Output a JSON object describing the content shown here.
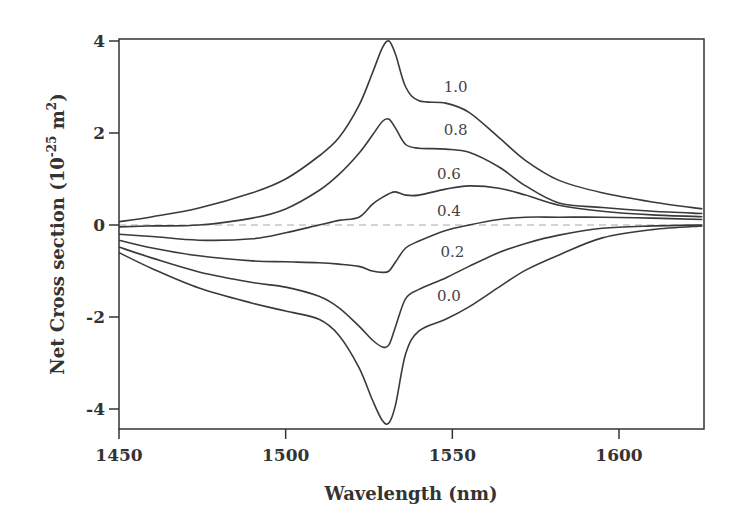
{
  "chart_data": {
    "type": "line",
    "title": "",
    "xlabel": "Wavelength (nm)",
    "ylabel": "Net Cross section (10^-25 m^2)",
    "ylabel_parts": {
      "main": "Net Cross section (10",
      "exp1": "-25",
      "mid": " m",
      "exp2": "2",
      "end": ")"
    },
    "xlim": [
      1450,
      1625
    ],
    "ylim": [
      -4.4,
      4.1
    ],
    "xticks": [
      1450,
      1500,
      1550,
      1600
    ],
    "xtick_labels": [
      "1450",
      "1500",
      "1550",
      "1600"
    ],
    "yticks": [
      4,
      2,
      0,
      -2,
      -4
    ],
    "ytick_labels": [
      "4",
      "2",
      "0",
      "-2",
      "-4"
    ],
    "grid": false,
    "legend": "inline labels",
    "reference_line": {
      "y": 0,
      "style": "dashed"
    },
    "x": [
      1450,
      1460,
      1474,
      1490,
      1500,
      1510,
      1516,
      1522,
      1526,
      1529,
      1531,
      1533,
      1536,
      1540,
      1548,
      1555,
      1564,
      1572,
      1582,
      1595,
      1610,
      1625
    ],
    "series": [
      {
        "name": "1.0",
        "label": "1.0",
        "label_pos": [
          1551,
          2.9
        ],
        "values": [
          0.07,
          0.18,
          0.37,
          0.7,
          1.0,
          1.5,
          1.9,
          2.6,
          3.3,
          3.85,
          4.0,
          3.7,
          3.0,
          2.7,
          2.65,
          2.45,
          1.9,
          1.4,
          0.97,
          0.7,
          0.5,
          0.35
        ]
      },
      {
        "name": "0.8",
        "label": "0.8",
        "label_pos": [
          1551,
          1.95
        ],
        "values": [
          -0.04,
          -0.02,
          0.0,
          0.15,
          0.35,
          0.75,
          1.1,
          1.56,
          1.95,
          2.25,
          2.3,
          2.1,
          1.75,
          1.67,
          1.65,
          1.58,
          1.26,
          0.85,
          0.48,
          0.38,
          0.3,
          0.25
        ]
      },
      {
        "name": "0.6",
        "label": "0.6",
        "label_pos": [
          1549,
          1.0
        ],
        "values": [
          -0.2,
          -0.25,
          -0.33,
          -0.3,
          -0.17,
          0.0,
          0.1,
          0.17,
          0.45,
          0.6,
          0.68,
          0.72,
          0.65,
          0.65,
          0.78,
          0.85,
          0.8,
          0.65,
          0.43,
          0.3,
          0.22,
          0.18
        ]
      },
      {
        "name": "0.4",
        "label": "0.4",
        "label_pos": [
          1549,
          0.2
        ],
        "values": [
          -0.33,
          -0.5,
          -0.67,
          -0.78,
          -0.8,
          -0.82,
          -0.85,
          -0.9,
          -1.0,
          -1.03,
          -1.0,
          -0.8,
          -0.5,
          -0.35,
          -0.12,
          0.0,
          0.12,
          0.17,
          0.17,
          0.17,
          0.15,
          0.12
        ]
      },
      {
        "name": "0.2",
        "label": "0.2",
        "label_pos": [
          1550,
          -0.7
        ],
        "values": [
          -0.48,
          -0.72,
          -1.02,
          -1.25,
          -1.35,
          -1.55,
          -1.8,
          -2.2,
          -2.5,
          -2.65,
          -2.6,
          -2.2,
          -1.6,
          -1.4,
          -1.15,
          -0.9,
          -0.6,
          -0.4,
          -0.22,
          -0.07,
          -0.02,
          0.0
        ]
      },
      {
        "name": "0.0",
        "label": "0.0",
        "label_pos": [
          1549,
          -1.65
        ],
        "values": [
          -0.6,
          -0.95,
          -1.37,
          -1.7,
          -1.87,
          -2.05,
          -2.4,
          -3.1,
          -3.8,
          -4.25,
          -4.3,
          -3.9,
          -2.8,
          -2.3,
          -2.05,
          -1.78,
          -1.35,
          -0.98,
          -0.65,
          -0.28,
          -0.1,
          -0.02
        ]
      }
    ]
  }
}
